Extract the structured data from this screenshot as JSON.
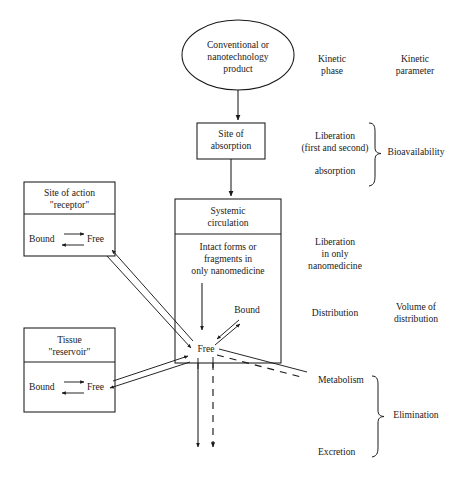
{
  "diagram": {
    "nodes": {
      "product": {
        "shape": "ellipse",
        "line1": "Conventional or",
        "line2": "nanotechnology",
        "line3": "product"
      },
      "absorption_site": {
        "shape": "box",
        "line1": "Site of",
        "line2": "absorption"
      },
      "systemic_circulation": {
        "shape": "box",
        "header_line1": "Systemic",
        "header_line2": "circulation",
        "body_line1": "Intact forms or",
        "body_line2": "fragments in",
        "body_line3": "only nanomedicine",
        "free_label": "Free",
        "bound_label": "Bound"
      },
      "site_of_action": {
        "shape": "box",
        "header_line1": "Site of action",
        "header_line2": "\"receptor\"",
        "bound_label": "Bound",
        "free_label": "Free"
      },
      "tissue": {
        "shape": "box",
        "header_line1": "Tissue",
        "header_line2": "\"reservoir\"",
        "bound_label": "Bound",
        "free_label": "Free"
      }
    },
    "columns": {
      "kinetic_phase_header_line1": "Kinetic",
      "kinetic_phase_header_line2": "phase",
      "kinetic_parameter_header_line1": "Kinetic",
      "kinetic_parameter_header_line2": "parameter"
    },
    "phases": {
      "liberation_line1": "Liberation",
      "liberation_line2": "(first and second)",
      "absorption": "absorption",
      "liberation_nano_line1": "Liberation",
      "liberation_nano_line2": "in only",
      "liberation_nano_line3": "nanomedicine",
      "distribution": "Distribution",
      "metabolism": "Metabolism",
      "excretion": "Excretion"
    },
    "parameters": {
      "bioavailability": "Bioavailability",
      "volume_of_distribution_line1": "Volume of",
      "volume_of_distribution_line2": "distribution",
      "elimination": "Elimination"
    },
    "colors": {
      "stroke": "#1a1a1a",
      "text": "#1a1a1a",
      "background": "#ffffff"
    }
  }
}
